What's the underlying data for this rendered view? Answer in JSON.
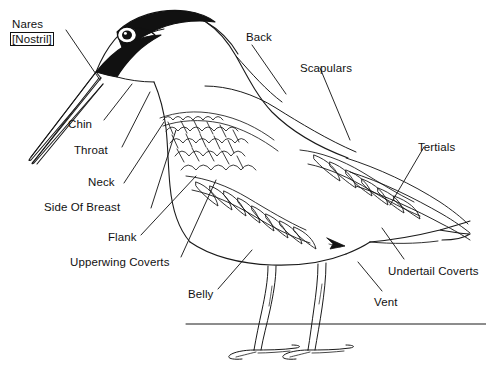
{
  "diagram": {
    "line_color": "#1a1a1a",
    "fill_color": "#ffffff",
    "dark_plumage_color": "#111111",
    "background": "#ffffff"
  },
  "labels": {
    "nares": "Nares",
    "nostril": "[Nostril]",
    "chin": "Chin",
    "throat": "Throat",
    "neck": "Neck",
    "side_of_breast": "Side Of Breast",
    "flank": "Flank",
    "upperwing_coverts": "Upperwing Coverts",
    "belly": "Belly",
    "back": "Back",
    "scapulars": "Scapulars",
    "tertials": "Tertials",
    "undertail_coverts": "Undertail Coverts",
    "vent": "Vent"
  },
  "icons": {
    "vent_pointer": "arrow-pointer-icon",
    "ground": "waterline-icon"
  }
}
